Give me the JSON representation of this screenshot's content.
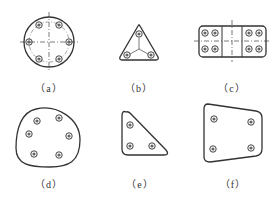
{
  "figures": [
    {
      "id": "a",
      "caption": "（a）",
      "shape": "circular flange",
      "bolts": 6
    },
    {
      "id": "b",
      "caption": "（b）",
      "shape": "triangular plate",
      "bolts": 3
    },
    {
      "id": "c",
      "caption": "（c）",
      "shape": "rectangular split plate",
      "bolts": 8
    },
    {
      "id": "d",
      "caption": "（d）",
      "shape": "irregular rounded plate",
      "bolts": 6
    },
    {
      "id": "e",
      "caption": "（e）",
      "shape": "right-triangle plate",
      "bolts": 3
    },
    {
      "id": "f",
      "caption": "（f）",
      "shape": "trapezoidal plate",
      "bolts": 4
    }
  ],
  "colors": {
    "stroke": "#333333",
    "bolt": "#555555"
  }
}
